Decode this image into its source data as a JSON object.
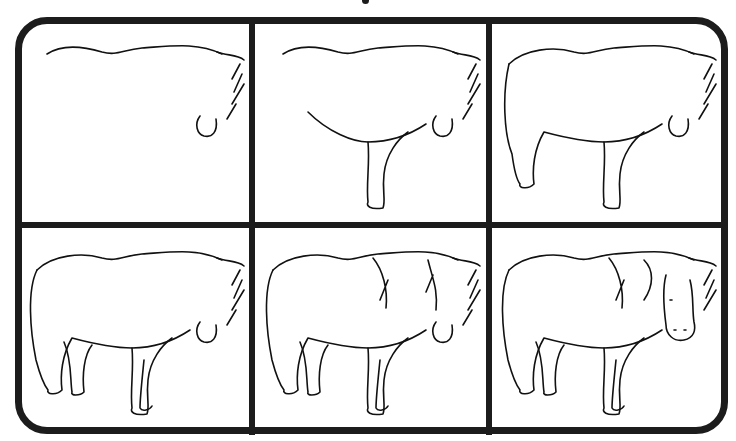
{
  "title": "",
  "steps": [
    {
      "step": 1,
      "parts": [
        "back",
        "mane",
        "muzzle"
      ]
    },
    {
      "step": 2,
      "parts": [
        "back",
        "mane",
        "muzzle",
        "belly",
        "front-leg"
      ]
    },
    {
      "step": 3,
      "parts": [
        "back",
        "mane",
        "muzzle",
        "belly",
        "front-leg",
        "rump",
        "hind-leg"
      ]
    },
    {
      "step": 4,
      "parts": [
        "back",
        "mane",
        "muzzle",
        "belly",
        "front-leg",
        "rump",
        "hind-leg",
        "tail",
        "far-legs"
      ]
    },
    {
      "step": 5,
      "parts": [
        "back",
        "mane",
        "muzzle",
        "belly",
        "legs",
        "tail",
        "forelock"
      ]
    },
    {
      "step": 6,
      "parts": [
        "back",
        "mane",
        "head",
        "eyes",
        "nostrils",
        "belly",
        "legs",
        "tail",
        "forelock"
      ]
    }
  ],
  "colors": {
    "line": "#111111",
    "frame": "#1c1c1c",
    "background": "#ffffff"
  }
}
